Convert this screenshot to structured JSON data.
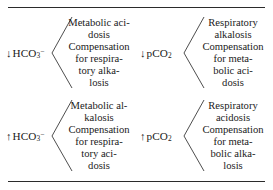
{
  "figure": {
    "name": "acid-base-disorders-table",
    "rule_color": "#2b2b2b",
    "text_color": "#1a1a1a"
  },
  "cells": [
    {
      "id": "decreased-bicarbonate",
      "label_arrow": "↓",
      "label_base": "HCO",
      "label_sub": "3",
      "label_sup": "−",
      "lines": [
        "Metabolic aci-",
        "dosis",
        "Compensation",
        "for respira-",
        "tory alka-",
        "losis"
      ]
    },
    {
      "id": "decreased-pco2",
      "label_arrow": "↓",
      "label_base": "pCO",
      "label_sub": "2",
      "label_sup": "",
      "lines": [
        "Respiratory",
        "alkalosis",
        "Compensation",
        "for meta-",
        "bolic aci-",
        "dosis"
      ]
    },
    {
      "id": "increased-bicarbonate",
      "label_arrow": "↑",
      "label_base": "HCO",
      "label_sub": "3",
      "label_sup": "−",
      "lines": [
        "Metabolic al-",
        "kalosis",
        "Compensation",
        "for respira-",
        "tory aci-",
        "dosis"
      ]
    },
    {
      "id": "increased-pco2",
      "label_arrow": "↑",
      "label_base": "pCO",
      "label_sub": "2",
      "label_sup": "",
      "lines": [
        "Respiratory",
        "acidosis",
        "Compensation",
        "for meta-",
        "bolic alka-",
        "losis"
      ]
    }
  ]
}
